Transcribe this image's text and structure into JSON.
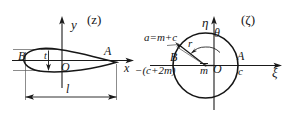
{
  "figure": {
    "background_color": "#ffffff",
    "stroke_color": "#1a1a1a",
    "thin_stroke_color": "#4a4a4a"
  },
  "left_panel": {
    "plane_label": "(z)",
    "axis_y_label": "y",
    "axis_x_label": "x",
    "origin_label": "O",
    "leading_edge_label": "B",
    "trailing_edge_label": "A",
    "thickness_label": "t",
    "chord_label": "l"
  },
  "right_panel": {
    "plane_label": "(ζ)",
    "axis_eta_label": "η",
    "axis_xi_label": "ξ",
    "origin_label": "O",
    "radius_label": "r",
    "angle_label": "θ",
    "center_offset_label": "m",
    "left_point_label": "B",
    "right_point_label": "A",
    "right_coordinate_label": "c",
    "top_left_annotation": "a=m+c",
    "left_annotation": "−(c+2m)"
  }
}
